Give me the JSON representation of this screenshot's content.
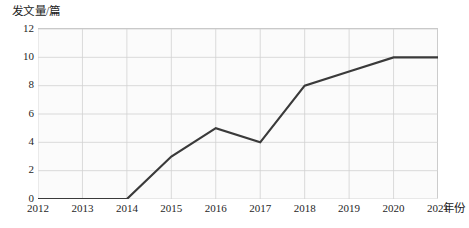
{
  "chart_data": {
    "type": "line",
    "title": "",
    "xlabel": "年份",
    "ylabel": "发文量/篇",
    "categories": [
      "2012",
      "2013",
      "2014",
      "2015",
      "2016",
      "2017",
      "2018",
      "2019",
      "2020",
      "2021"
    ],
    "x": [
      2012,
      2013,
      2014,
      2015,
      2016,
      2017,
      2018,
      2019,
      2020,
      2021
    ],
    "values": [
      0,
      0,
      0,
      3,
      5,
      4,
      8,
      9,
      10,
      10
    ],
    "series": [
      {
        "name": "发文量",
        "values": [
          0,
          0,
          0,
          3,
          5,
          4,
          8,
          9,
          10,
          10
        ]
      }
    ],
    "ylim": [
      0,
      12
    ],
    "yticks": [
      0,
      2,
      4,
      6,
      8,
      10,
      12
    ],
    "ytick_labels": [
      "0",
      "2",
      "4",
      "6",
      "8",
      "10",
      "12"
    ],
    "xtick_labels": [
      "2012",
      "2013",
      "2014",
      "2015",
      "2016",
      "2017",
      "2018",
      "2019",
      "2020",
      "2021"
    ],
    "grid": true,
    "grid_color": "#d2d2d2",
    "legend": "none",
    "line_color": "#3a3a3a",
    "line_width": 2.2,
    "markers": false,
    "plot_background": "#fbfbfb"
  },
  "axes": {
    "y_title": "发文量/篇",
    "x_title": "年份"
  }
}
